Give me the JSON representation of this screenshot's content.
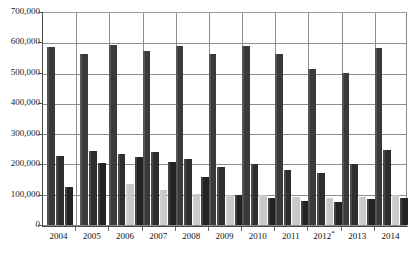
{
  "chart_data": {
    "type": "bar",
    "title": "",
    "subtitle": "",
    "xlabel": "",
    "ylabel": "",
    "ylim": [
      0,
      700000
    ],
    "ytick_labels": [
      "700,000",
      "600,000",
      "500,000",
      "400,000",
      "300,000",
      "200,000",
      "100,000",
      "0"
    ],
    "ytick_values": [
      700000,
      600000,
      500000,
      400000,
      300000,
      200000,
      100000,
      0
    ],
    "grid": true,
    "legend_position": "none",
    "categories": [
      "2004",
      "2005",
      "2006",
      "2007",
      "2008",
      "2009",
      "2010",
      "2011",
      "2012*",
      "2013",
      "2014"
    ],
    "category_notes": {
      "2012*": "asterisk denotes provisional value"
    },
    "series": [
      {
        "name": "series-1",
        "color": "#3a3a3a",
        "values": [
          587000,
          565000,
          595000,
          574000,
          590000,
          566000,
          591000,
          566000,
          516000,
          503000,
          583000
        ]
      },
      {
        "name": "series-2",
        "color": "#2e2e2e",
        "values": [
          227000,
          243000,
          234000,
          241000,
          219000,
          193000,
          202000,
          183000,
          173000,
          202000,
          247000
        ]
      },
      {
        "name": "series-3",
        "color": "#c9c9c9",
        "values": [
          0,
          0,
          137000,
          114000,
          104000,
          99000,
          100000,
          91000,
          88000,
          94000,
          98000
        ]
      },
      {
        "name": "series-4",
        "color": "#232323",
        "values": [
          124000,
          204000,
          226000,
          209000,
          157000,
          99000,
          88000,
          80000,
          77000,
          86000,
          89000
        ]
      }
    ],
    "series_2004_2005_note": "series-3 absent for 2004 and 2005"
  }
}
